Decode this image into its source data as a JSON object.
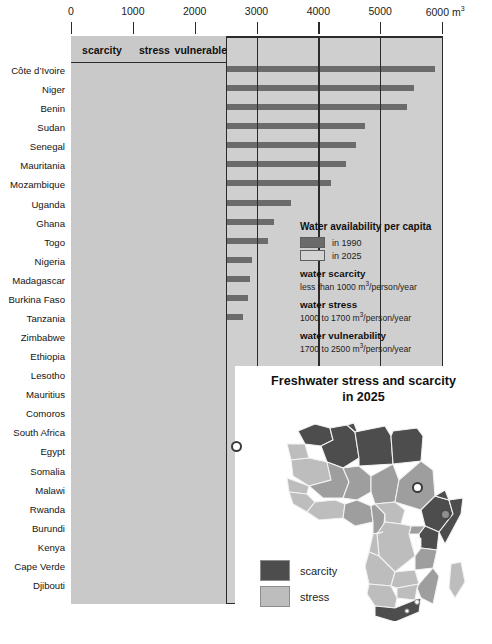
{
  "chart_data": {
    "type": "bar",
    "title": "Water availability per capita",
    "xlabel": "m3",
    "ylabel": "",
    "xlim": [
      0,
      6000
    ],
    "grid": true,
    "orientation": "horizontal",
    "axis_unit": "m",
    "axis_unit_sup": "3",
    "ticks": [
      {
        "value": 0,
        "label": "0"
      },
      {
        "value": 1000,
        "label": "1000"
      },
      {
        "value": 2000,
        "label": "2000"
      },
      {
        "value": 3000,
        "label": "3000"
      },
      {
        "value": 4000,
        "label": "4000"
      },
      {
        "value": 5000,
        "label": "5000"
      },
      {
        "value": 6000,
        "label": "6000"
      }
    ],
    "bands": [
      {
        "label": "scarcity",
        "from": 0,
        "to": 1000
      },
      {
        "label": "stress",
        "from": 1000,
        "to": 1700
      },
      {
        "label": "vulnerable",
        "from": 1700,
        "to": 2500
      }
    ],
    "categories": [
      "Côte d’Ivoire",
      "Niger",
      "Benin",
      "Sudan",
      "Senegal",
      "Mauritania",
      "Mozambique",
      "Uganda",
      "Ghana",
      "Togo",
      "Nigeria",
      "Madagascar",
      "Burkina Faso",
      "Tanzania",
      "Zimbabwe",
      "Ethiopia",
      "Lesotho",
      "Mauritius",
      "Comoros",
      "South Africa",
      "Egypt",
      "Somalia",
      "Malawi",
      "Rwanda",
      "Burundi",
      "Kenya",
      "Cape Verde",
      "Djibouti"
    ],
    "series": [
      {
        "name": "in 1990",
        "color": "#6b6b6b",
        "values": [
          5880,
          5540,
          5440,
          4750,
          4610,
          4440,
          4200,
          3560,
          3280,
          3190,
          2920,
          2900,
          2870,
          2780,
          2100,
          2080,
          2010,
          1950,
          1700,
          1390,
          1130,
          1080,
          1110,
          980,
          740,
          760,
          760,
          540
        ]
      },
      {
        "name": "in 2025",
        "color": "#b0b0b0",
        "values": [
          2070,
          2050,
          2000,
          1960,
          2020,
          1960,
          1730,
          1550,
          1210,
          1800,
          1120,
          1500,
          1070,
          1050,
          1030,
          1020,
          1020,
          1000,
          1460,
          830,
          630,
          570,
          600,
          560,
          460,
          430,
          490,
          380
        ]
      }
    ],
    "legend_position": "right"
  },
  "legend": {
    "title": "Water availability per capita",
    "items": [
      {
        "label": "in 1990",
        "swatch": "dark"
      },
      {
        "label": "in 2025",
        "swatch": "light"
      }
    ],
    "definitions": [
      {
        "heading": "water scarcity",
        "detail_pre": "less than 1000 m",
        "sup": "3",
        "detail_post": "/person/year"
      },
      {
        "heading": "water stress",
        "detail_pre": "1000 to 1700 m",
        "sup": "3",
        "detail_post": "/person/year"
      },
      {
        "heading": "water vulnerability",
        "detail_pre": "1700 to 2500 m",
        "sup": "3",
        "detail_post": "/person/year"
      }
    ]
  },
  "map": {
    "title_line1": "Freshwater stress and scarcity",
    "title_line2": "in 2025",
    "legend": [
      {
        "label": "scarcity",
        "swatch": "scarcity"
      },
      {
        "label": "stress",
        "swatch": "stress"
      }
    ],
    "colors": {
      "scarcity": "#4d4d4d",
      "stress": "#bdbdbd",
      "other": "#e8e8e8"
    }
  },
  "colors": {
    "plot_background": "#cfcfcf",
    "band_background": "#c9c9c9",
    "bar_1990": "#6b6b6b",
    "bar_2025": "#b0b0b0",
    "axis": "#2b2b2b",
    "page_background": "#ffffff"
  }
}
